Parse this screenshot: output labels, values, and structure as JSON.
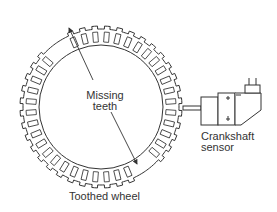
{
  "labels": {
    "missing_line1": "Missing",
    "missing_line2": "teeth",
    "wheel": "Toothed wheel",
    "sensor_line1": "Crankshaft",
    "sensor_line2": "sensor"
  },
  "wheel": {
    "cx": 101,
    "cy": 99,
    "outer_r": 83,
    "tooth_h": 3,
    "inner_r": 65,
    "tooth_count": 40,
    "missing_tooth_angles_deg": [
      -128,
      -124,
      52,
      56
    ],
    "stroke": "#333333"
  },
  "arrows": [
    {
      "from": [
        93,
        80
      ],
      "to": [
        69,
        28
      ]
    },
    {
      "from": [
        111,
        112
      ],
      "to": [
        137,
        164
      ]
    }
  ],
  "colors": {
    "line": "#333333",
    "text": "#333333",
    "accent_grey": "#999999",
    "background": "#ffffff"
  }
}
